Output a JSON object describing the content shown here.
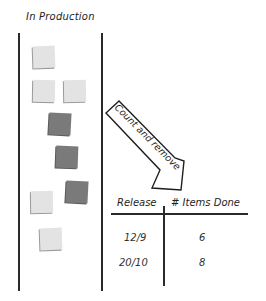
{
  "board": {
    "column_title": "In Production",
    "stickies": [
      {
        "color": "light",
        "x": 33,
        "y": 46,
        "rot": -2
      },
      {
        "color": "light",
        "x": 33,
        "y": 80,
        "rot": 1
      },
      {
        "color": "light",
        "x": 64,
        "y": 80,
        "rot": -1
      },
      {
        "color": "dark",
        "x": 49,
        "y": 113,
        "rot": 3
      },
      {
        "color": "dark",
        "x": 56,
        "y": 146,
        "rot": 2
      },
      {
        "color": "dark",
        "x": 66,
        "y": 181,
        "rot": 3
      },
      {
        "color": "light",
        "x": 31,
        "y": 191,
        "rot": -1
      },
      {
        "color": "light",
        "x": 40,
        "y": 228,
        "rot": -2
      }
    ],
    "colors": {
      "light": "#e3e3e3",
      "dark": "#7a7a7a",
      "line": "#2a2a2a"
    }
  },
  "arrow": {
    "label": "Count and remove"
  },
  "table": {
    "headers": [
      "Release",
      "# Items Done"
    ],
    "rows": [
      {
        "release": "12/9",
        "items_done": "6"
      },
      {
        "release": "20/10",
        "items_done": "8"
      }
    ]
  }
}
